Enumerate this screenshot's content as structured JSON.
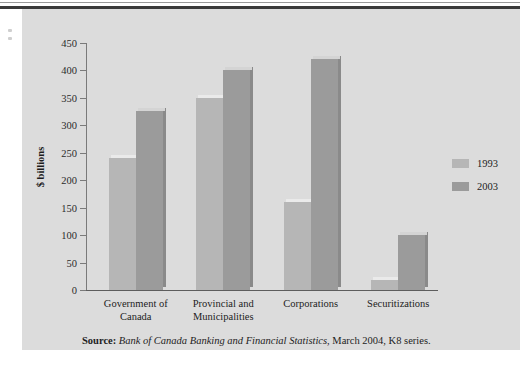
{
  "chart_data": {
    "type": "bar",
    "title": "",
    "subtitle": "",
    "xlabel": "",
    "ylabel": "$ billions",
    "ylim": [
      0,
      450
    ],
    "ytick_step": 50,
    "yticks": [
      450,
      400,
      350,
      300,
      250,
      200,
      150,
      100,
      50,
      0
    ],
    "grid": false,
    "legend_position": "right",
    "categories": [
      "Government of Canada",
      "Provincial and Municipalities",
      "Corporations",
      "Securitizations"
    ],
    "category_lines": [
      [
        "Government of",
        "Canada"
      ],
      [
        "Provincial and",
        "Municipalities"
      ],
      [
        "Corporations"
      ],
      [
        "Securitizations"
      ]
    ],
    "series": [
      {
        "name": "1993",
        "color": "#b6b6b6",
        "values": [
          240,
          350,
          160,
          18
        ]
      },
      {
        "name": "2003",
        "color": "#9b9b9b",
        "values": [
          327,
          400,
          420,
          100
        ]
      }
    ]
  },
  "legend": {
    "items": [
      {
        "label": "1993"
      },
      {
        "label": "2003"
      }
    ]
  },
  "source": {
    "prefix": "Source:",
    "publication": "Bank of Canada Banking and Financial Statistics",
    "suffix": ", March 2004, K8 series."
  },
  "colors": {
    "panel_background": "#dcdcdc",
    "page_background": "#ffffff",
    "axis": "#7a7a7a",
    "baseline": "#5d5d5d",
    "text": "#1c1c1c",
    "series_1993": "#b6b6b6",
    "series_2003": "#9b9b9b",
    "top_rule": "#3a3a3a"
  }
}
